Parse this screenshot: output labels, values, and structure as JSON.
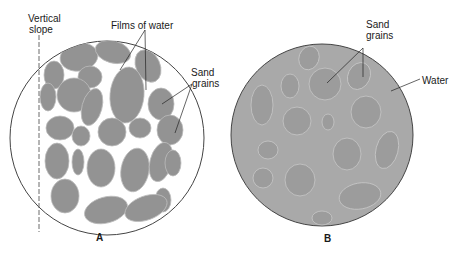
{
  "panels": [
    {
      "id": "A",
      "label": "A",
      "annotations": {
        "vertical_slope_line1": "Vertical",
        "vertical_slope_line2": "slope",
        "films_of_water": "Films of water",
        "sand_grains_line1": "Sand",
        "sand_grains_line2": "grains"
      }
    },
    {
      "id": "B",
      "label": "B",
      "annotations": {
        "sand_grains_line1": "Sand",
        "sand_grains_line2": "grains",
        "water": "Water"
      }
    }
  ],
  "colors": {
    "grain_a": "#939393",
    "circle_b_fill": "#a9a9a9",
    "grain_b": "#9a9a9a",
    "outline": "#444444"
  }
}
